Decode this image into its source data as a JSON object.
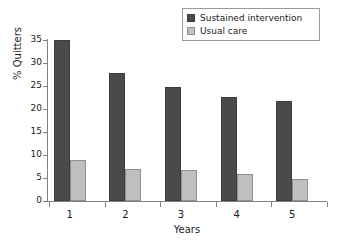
{
  "chart_data": {
    "type": "bar",
    "title": "",
    "xlabel": "Years",
    "ylabel": "% Quitters",
    "categories": [
      "1",
      "2",
      "3",
      "4",
      "5"
    ],
    "series": [
      {
        "name": "Sustained intervention",
        "color": "#4a4a4a",
        "values": [
          35.1,
          27.8,
          24.8,
          22.6,
          21.7
        ]
      },
      {
        "name": "Usual care",
        "color": "#bfbfbf",
        "values": [
          9.0,
          6.9,
          6.8,
          5.9,
          4.7
        ]
      }
    ],
    "ylim": [
      0,
      35
    ],
    "yticks": [
      "0",
      "5",
      "10",
      "15",
      "20",
      "25",
      "30",
      "35"
    ],
    "ytick_values": [
      0,
      5,
      10,
      15,
      20,
      25,
      30,
      35
    ],
    "grid": false,
    "legend_position": "top-right"
  },
  "legend": {
    "items": [
      {
        "label": "Sustained intervention",
        "color": "#4a4a4a"
      },
      {
        "label": "Usual care",
        "color": "#bfbfbf"
      }
    ]
  },
  "axes": {
    "y_label": "% Quitters",
    "x_label": "Years"
  }
}
